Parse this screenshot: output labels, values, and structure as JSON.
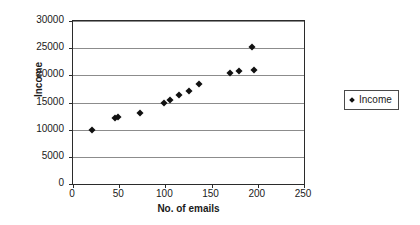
{
  "chart_data": {
    "type": "scatter",
    "title": "",
    "xlabel": "No. of emails",
    "ylabel": "Income",
    "xlim": [
      0,
      250
    ],
    "ylim": [
      0,
      30000
    ],
    "xticks": [
      0,
      50,
      100,
      150,
      200,
      250
    ],
    "yticks": [
      0,
      5000,
      10000,
      15000,
      20000,
      25000,
      30000
    ],
    "xtick_labels": [
      "0",
      "50",
      "100",
      "150",
      "200",
      "250"
    ],
    "ytick_labels": [
      "0",
      "5000",
      "10000",
      "15000",
      "20000",
      "25000",
      "30000"
    ],
    "grid": "horizontal",
    "legend_position": "right",
    "series": [
      {
        "name": "Income",
        "marker": "diamond",
        "color": "#111111",
        "points": [
          {
            "x": 21,
            "y": 10000
          },
          {
            "x": 45,
            "y": 12100
          },
          {
            "x": 49,
            "y": 12300
          },
          {
            "x": 73,
            "y": 13100
          },
          {
            "x": 98,
            "y": 14900
          },
          {
            "x": 105,
            "y": 15400
          },
          {
            "x": 115,
            "y": 16300
          },
          {
            "x": 126,
            "y": 17100
          },
          {
            "x": 136,
            "y": 18400
          },
          {
            "x": 170,
            "y": 20400
          },
          {
            "x": 180,
            "y": 20800
          },
          {
            "x": 194,
            "y": 25200
          },
          {
            "x": 196,
            "y": 20900
          }
        ]
      }
    ]
  },
  "legend": {
    "entries": [
      {
        "label": "Income"
      }
    ]
  }
}
